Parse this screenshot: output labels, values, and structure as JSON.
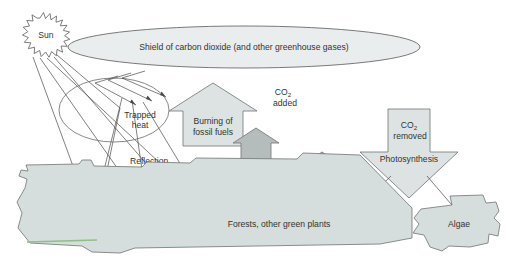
{
  "diagram": {
    "type": "process-diagram"
  },
  "labels": {
    "sun": "Sun",
    "shield": "Shield of carbon dioxide (and other greenhouse gases)",
    "trapped_heat_line1": "Trapped",
    "trapped_heat_line2": "heat",
    "reflection_line1": "Reflection",
    "reflection_line2": "of light",
    "fossil_fuels_line1": "Burning of",
    "fossil_fuels_line2": "fossil fuels",
    "co2_added_line1": "CO",
    "co2_added_sub": "2",
    "co2_added_line2": "added",
    "burning_forests_line1": "Burning of",
    "burning_forests_line2": "forests",
    "other_sources_line1": "Other",
    "other_sources_line2": "sources",
    "co2_removed_line1": "CO",
    "co2_removed_sub": "2",
    "co2_removed_line2": "removed",
    "photosynthesis": "Photosynthesis",
    "forests_plants": "Forests, other green plants",
    "algae": "Algae"
  },
  "colors": {
    "shield_fill": "#e9eded",
    "land_fill": "#d5dddd",
    "arrow_light_fill": "#dde3e3",
    "arrow_mid_fill": "#b4bcbc",
    "arrow_dark_fill": "#aab2b2",
    "outline": "#6b6b6b",
    "text": "#333333",
    "green_edge": "#8fbf8a",
    "background": "#ffffff"
  },
  "icons": {
    "sun": "sun-starburst-icon",
    "up_arrow": "up-arrow-icon",
    "down_arrow": "down-arrow-icon",
    "ray": "ray-line-icon"
  }
}
